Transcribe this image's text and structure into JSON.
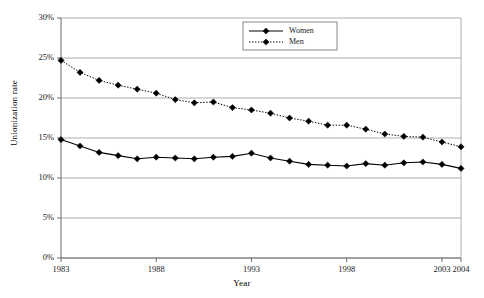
{
  "chart_data": {
    "type": "line",
    "title": "",
    "xlabel": "Year",
    "ylabel": "Unionization rate",
    "xlim": [
      1983,
      2004
    ],
    "ylim": [
      0,
      30
    ],
    "grid": true,
    "legend_position": "top-center",
    "x": [
      1983,
      1984,
      1985,
      1986,
      1987,
      1988,
      1989,
      1990,
      1991,
      1992,
      1993,
      1994,
      1995,
      1996,
      1997,
      1998,
      1999,
      2000,
      2001,
      2002,
      2003,
      2004
    ],
    "ytick_labels": [
      "0%",
      "5%",
      "10%",
      "15%",
      "20%",
      "25%",
      "30%"
    ],
    "ytick_values": [
      0,
      5,
      10,
      15,
      20,
      25,
      30
    ],
    "xtick_labels": [
      "1983",
      "1988",
      "1993",
      "1998",
      "2003",
      "2004"
    ],
    "xtick_values": [
      1983,
      1988,
      1993,
      1998,
      2003,
      2004
    ],
    "series": [
      {
        "name": "Women",
        "style": "solid",
        "marker": "diamond",
        "color": "#000000",
        "values": [
          14.8,
          14.0,
          13.2,
          12.8,
          12.4,
          12.6,
          12.5,
          12.4,
          12.6,
          12.7,
          13.1,
          12.5,
          12.1,
          11.7,
          11.6,
          11.5,
          11.8,
          11.6,
          11.9,
          12.0,
          11.7,
          11.2
        ]
      },
      {
        "name": "Men",
        "style": "dotted",
        "marker": "diamond",
        "color": "#000000",
        "values": [
          24.7,
          23.2,
          22.2,
          21.6,
          21.1,
          20.6,
          19.8,
          19.4,
          19.5,
          18.8,
          18.5,
          18.1,
          17.5,
          17.1,
          16.6,
          16.6,
          16.1,
          15.5,
          15.2,
          15.1,
          14.5,
          13.9
        ]
      }
    ]
  },
  "legend": {
    "entries": [
      {
        "label": "Women"
      },
      {
        "label": "Men"
      }
    ]
  }
}
